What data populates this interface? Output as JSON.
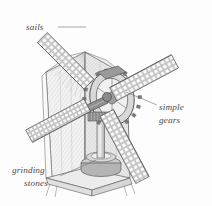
{
  "figure": {
    "style": "engraved line drawing with halftone shading",
    "background_color": "#fdfdfd",
    "ink_color": "#5b5b5b",
    "label_color": "#4a4a4a"
  },
  "labels": [
    {
      "id": "sails",
      "lines": [
        "sails"
      ],
      "text_x": 26,
      "text_y": 30,
      "leader_path": "M 58 27 L 86 27",
      "target": "upper-left sail blade"
    },
    {
      "id": "simple-gears",
      "lines": [
        "simple",
        "gears"
      ],
      "text_x": 159,
      "text_y": 110,
      "leader_path": "M 157 105 L 126 92",
      "target": "gear assembly"
    },
    {
      "id": "grinding-stones",
      "lines": [
        "grinding",
        "stones"
      ],
      "text_x": 12,
      "text_y": 173,
      "leader_path": "M 60 176 L 96 160",
      "target": "millstone base"
    }
  ],
  "parts": [
    {
      "id": "sail-upper-left",
      "name": "upper left lattice sail",
      "color": "#c9c9c9"
    },
    {
      "id": "sail-upper-right",
      "name": "upper right lattice sail",
      "color": "#c9c9c9"
    },
    {
      "id": "sail-lower-left",
      "name": "lower left lattice sail",
      "color": "#c9c9c9"
    },
    {
      "id": "sail-lower-right",
      "name": "lower right lattice sail",
      "color": "#c9c9c9"
    },
    {
      "id": "mill-body",
      "name": "faceted mill tower body",
      "color": "#ededed"
    },
    {
      "id": "mill-roof",
      "name": "mill cap roof",
      "color": "#f2f2f2"
    },
    {
      "id": "gear-wheel",
      "name": "large toothed brake wheel",
      "color": "#9a9a9a"
    },
    {
      "id": "horizontal-shaft",
      "name": "windshaft",
      "color": "#8f8f8f"
    },
    {
      "id": "vertical-shaft",
      "name": "upright drive shaft",
      "color": "#b5b5b5"
    },
    {
      "id": "millstone",
      "name": "grinding stone drum",
      "color": "#c0c0c0"
    },
    {
      "id": "floor",
      "name": "mill floor platform",
      "color": "#e4e4e4"
    }
  ],
  "colors": {
    "sail_fill": "#c9c9c9",
    "sail_cell": "#fbfbfb",
    "body_light": "#f4f4f4",
    "body_mid": "#e6e6e6",
    "body_dark": "#d4d4d4",
    "gear_dark": "#8a8a8a",
    "gear_mid": "#a8a8a8",
    "stroke": "#5b5b5b"
  }
}
